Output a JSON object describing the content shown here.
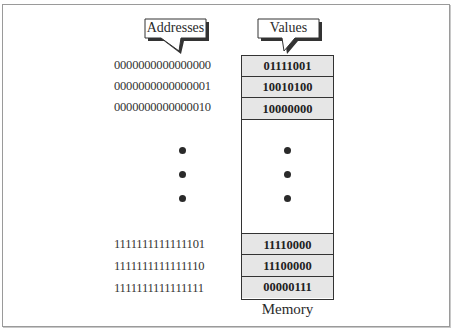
{
  "diagram": {
    "callouts": {
      "addresses_label": "Addresses",
      "values_label": "Values"
    },
    "top_rows": [
      {
        "address": "0000000000000000",
        "value": "01111001"
      },
      {
        "address": "0000000000000001",
        "value": "10010100"
      },
      {
        "address": "0000000000000010",
        "value": "10000000"
      }
    ],
    "bottom_rows": [
      {
        "address": "1111111111111101",
        "value": "11110000"
      },
      {
        "address": "1111111111111110",
        "value": "11100000"
      },
      {
        "address": "1111111111111111",
        "value": "00000111"
      }
    ],
    "ellipsis": "vertical-dots",
    "memory_caption": "Memory",
    "colors": {
      "cell_fill": "#e6e6e6",
      "border": "#333333",
      "frame": "#9a9a9a"
    }
  }
}
